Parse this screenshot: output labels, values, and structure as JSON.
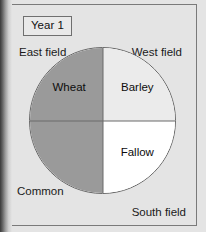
{
  "figure": {
    "background_color": "#e4e4e4",
    "frame_border_color": "#7a7a7a"
  },
  "year_badge": {
    "label": "Year 1"
  },
  "corner_labels": {
    "top_left": "East field",
    "top_right": "West field",
    "bottom_left": "Common",
    "bottom_right": "South field"
  },
  "chart_data": {
    "type": "pie",
    "title": "Year 1",
    "xlabel": "",
    "ylabel": "",
    "legend_position": "none",
    "grid": false,
    "categories": [
      "Wheat",
      "Barley",
      "Fallow",
      "Common"
    ],
    "values": [
      25,
      25,
      25,
      25
    ],
    "slices": [
      {
        "label": "Wheat",
        "value": 25,
        "start_angle": 270,
        "end_angle": 360,
        "quadrant": "top-left",
        "color": "#9a9a9a"
      },
      {
        "label": "Barley",
        "value": 25,
        "start_angle": 0,
        "end_angle": 90,
        "quadrant": "top-right",
        "color": "#ebebeb"
      },
      {
        "label": "Fallow",
        "value": 25,
        "start_angle": 90,
        "end_angle": 180,
        "quadrant": "bottom-right",
        "color": "#ffffff"
      },
      {
        "label": "Common",
        "value": 25,
        "start_angle": 180,
        "end_angle": 270,
        "quadrant": "bottom-left",
        "color": "#9a9a9a"
      }
    ],
    "annotations": [
      "East field",
      "West field",
      "South field",
      "Common"
    ],
    "outline_color": "#676767",
    "divider_color": "#6b6b6b"
  }
}
